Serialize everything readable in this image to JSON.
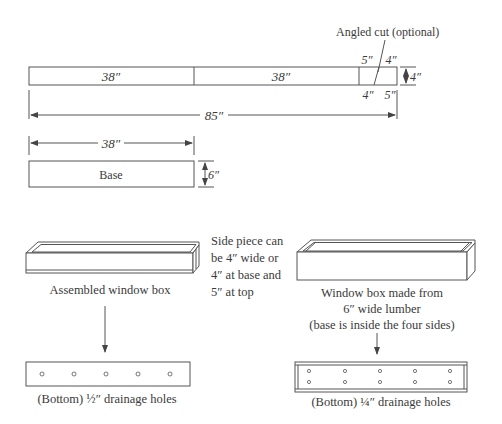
{
  "cut_diagram": {
    "segments": [
      {
        "label": "38″"
      },
      {
        "label": "38″"
      }
    ],
    "angled_cut_label": "Angled cut (optional)",
    "end_top_left": "5″",
    "end_top_right": "4″",
    "end_bottom_left": "4″",
    "end_bottom_right": "5″",
    "height_label": "4″",
    "total_length_label": "85″"
  },
  "base_piece": {
    "width_label": "38″",
    "height_label": "6″",
    "label": "Base"
  },
  "assembled_box": {
    "caption": "Assembled window box",
    "side_note": [
      "Side piece can",
      "be 4″ wide or",
      "4″ at base and",
      "5″ at top"
    ],
    "bottom_caption": "(Bottom) ½″ drainage holes",
    "hole_rows": 1,
    "hole_cols": 5
  },
  "wide_box": {
    "caption": [
      "Window box made from",
      "6″ wide lumber",
      "(base is inside the four sides)"
    ],
    "bottom_caption": "(Bottom) ¼″ drainage holes",
    "hole_rows": 2,
    "hole_cols": 5
  }
}
